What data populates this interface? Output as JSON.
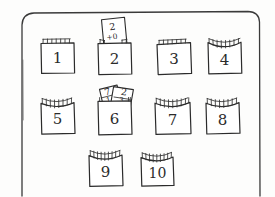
{
  "scene": {
    "title": "Pocket chart sketch",
    "description": "Hand-drawn sketch of a rectangular board holding ten numbered pockets; cards peek out of pocket 2 and pocket 6.",
    "background_color": "#fdfdfc",
    "ink_color": "#2b2b2b"
  },
  "board": {
    "name": "board-frame",
    "shape": "rounded-rectangle",
    "style": "hand-drawn outline, bottom edge cropped by image border"
  },
  "pockets": [
    {
      "id": "pocket-1",
      "label": "1",
      "row": 1,
      "col": 1,
      "x": 41,
      "y": 43,
      "w": 33,
      "h": 30,
      "top_edge": "straight",
      "fringe_ticks": 7
    },
    {
      "id": "pocket-2",
      "label": "2",
      "row": 1,
      "col": 2,
      "x": 98,
      "y": 43,
      "w": 33,
      "h": 30,
      "top_edge": "straight",
      "fringe_ticks": 7
    },
    {
      "id": "pocket-3",
      "label": "3",
      "row": 1,
      "col": 3,
      "x": 157,
      "y": 43,
      "w": 33,
      "h": 30,
      "top_edge": "straight",
      "fringe_ticks": 7
    },
    {
      "id": "pocket-4",
      "label": "4",
      "row": 1,
      "col": 4,
      "x": 208,
      "y": 43,
      "w": 33,
      "h": 30,
      "top_edge": "curved",
      "fringe_ticks": 8
    },
    {
      "id": "pocket-5",
      "label": "5",
      "row": 2,
      "col": 1,
      "x": 41,
      "y": 103,
      "w": 33,
      "h": 30,
      "top_edge": "curved",
      "fringe_ticks": 8
    },
    {
      "id": "pocket-6",
      "label": "6",
      "row": 2,
      "col": 2,
      "x": 98,
      "y": 103,
      "w": 33,
      "h": 30,
      "top_edge": "straight",
      "fringe_ticks": 6
    },
    {
      "id": "pocket-7",
      "label": "7",
      "row": 2,
      "col": 3,
      "x": 155,
      "y": 103,
      "w": 35,
      "h": 30,
      "top_edge": "curved",
      "fringe_ticks": 9
    },
    {
      "id": "pocket-8",
      "label": "8",
      "row": 2,
      "col": 4,
      "x": 206,
      "y": 103,
      "w": 33,
      "h": 30,
      "top_edge": "curved",
      "fringe_ticks": 8
    },
    {
      "id": "pocket-9",
      "label": "9",
      "row": 3,
      "col": 2,
      "x": 89,
      "y": 155,
      "w": 33,
      "h": 30,
      "top_edge": "curved",
      "fringe_ticks": 9
    },
    {
      "id": "pocket-10",
      "label": "10",
      "row": 3,
      "col": 3,
      "x": 141,
      "y": 157,
      "w": 32,
      "h": 28,
      "top_edge": "curved",
      "fringe_ticks": 9
    }
  ],
  "cards": [
    {
      "id": "card-in-pocket-2",
      "in_pocket": "pocket-2",
      "tilt_deg": -8,
      "lines": [
        "2",
        "+0"
      ],
      "top_text": "2",
      "bottom_text": "+0"
    },
    {
      "id": "card-6-back",
      "in_pocket": "pocket-6",
      "tilt_deg": -12,
      "lines": [
        "7",
        "1"
      ],
      "top_text": "7",
      "bottom_text": "1"
    },
    {
      "id": "card-6-front",
      "in_pocket": "pocket-6",
      "tilt_deg": 18,
      "lines": [
        "2",
        "3"
      ],
      "top_text": "2",
      "bottom_text": "3"
    }
  ]
}
